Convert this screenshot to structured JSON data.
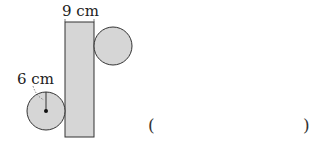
{
  "figure": {
    "rect_width_label": "9 cm",
    "radius_label": "6 cm",
    "fill_color": "#d6d6d6",
    "stroke_color": "#333333"
  },
  "answer": {
    "open_paren": "(",
    "close_paren": ")",
    "value": ""
  }
}
